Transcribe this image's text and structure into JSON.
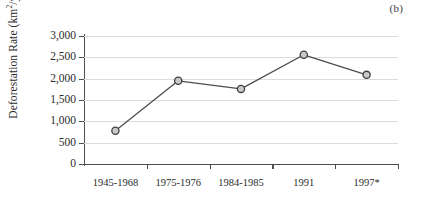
{
  "panel": {
    "label": "(b)"
  },
  "chart_data": {
    "type": "line",
    "title": "",
    "subtitle": "",
    "xlabel": "",
    "ylabel": "Deforestation Rate (km2/year)",
    "ylabel_parts": {
      "prefix": "Deforestation Rate (km",
      "superscript": "2",
      "suffix": "/year)"
    },
    "categories": [
      "1945-1968",
      "1975-1976",
      "1984-1985",
      "1991",
      "1997*"
    ],
    "values": [
      780,
      1950,
      1760,
      2560,
      2090
    ],
    "series": [
      {
        "name": "Deforestation Rate",
        "values": [
          780,
          1950,
          1760,
          2560,
          2090
        ]
      }
    ],
    "ylim": [
      0,
      3000
    ],
    "yticks": [
      0,
      500,
      1000,
      1500,
      2000,
      2500,
      3000
    ],
    "ytick_labels": [
      "0",
      "500",
      "1,000",
      "1,500",
      "2,000",
      "2,500",
      "3,000"
    ],
    "grid": "horizontal",
    "legend": "none",
    "marker": "circle",
    "colors": {
      "line": "#4d4d4d",
      "marker_fill": "#c9c9c9",
      "marker_edge": "#3f3f3f",
      "gridline": "#dcdcdc",
      "axis": "#4d4d4d",
      "text": "#2b2b2b"
    }
  }
}
